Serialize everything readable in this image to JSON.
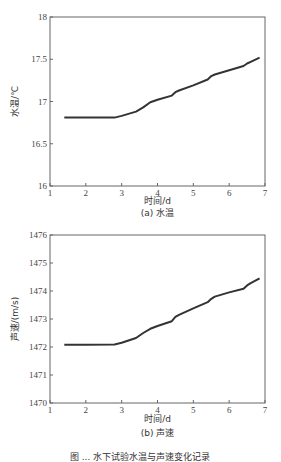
{
  "chart_data": [
    {
      "type": "line",
      "title": "",
      "caption": "(a) 水温",
      "xlabel": "时间/d",
      "ylabel": "水温/℃",
      "xlim": [
        1,
        7
      ],
      "ylim": [
        16,
        18
      ],
      "xticks": [
        "1",
        "2",
        "3",
        "4",
        "5",
        "6",
        "7"
      ],
      "yticks": [
        "16",
        "16.5",
        "17",
        "17.5",
        "18"
      ],
      "grid": false,
      "series": [
        {
          "name": "水温",
          "x": [
            1.4,
            2.0,
            2.8,
            3.0,
            3.4,
            3.6,
            3.8,
            4.0,
            4.4,
            4.5,
            4.6,
            5.0,
            5.4,
            5.5,
            5.6,
            6.0,
            6.4,
            6.5,
            6.6,
            6.85
          ],
          "y": [
            16.81,
            16.81,
            16.81,
            16.83,
            16.88,
            16.93,
            16.99,
            17.02,
            17.07,
            17.11,
            17.13,
            17.19,
            17.26,
            17.3,
            17.32,
            17.37,
            17.42,
            17.45,
            17.47,
            17.52
          ]
        }
      ]
    },
    {
      "type": "line",
      "title": "",
      "caption": "(b) 声速",
      "xlabel": "时间/d",
      "ylabel": "声速/(m/s)",
      "xlim": [
        1,
        7
      ],
      "ylim": [
        1470,
        1476
      ],
      "xticks": [
        "1",
        "2",
        "3",
        "4",
        "5",
        "6",
        "7"
      ],
      "yticks": [
        "1470",
        "1471",
        "1472",
        "1473",
        "1474",
        "1475",
        "1476"
      ],
      "grid": false,
      "series": [
        {
          "name": "声速",
          "x": [
            1.4,
            2.0,
            2.8,
            3.0,
            3.4,
            3.6,
            3.8,
            4.0,
            4.4,
            4.5,
            4.6,
            5.0,
            5.4,
            5.5,
            5.6,
            6.0,
            6.4,
            6.5,
            6.6,
            6.85
          ],
          "y": [
            1472.08,
            1472.08,
            1472.09,
            1472.15,
            1472.32,
            1472.5,
            1472.65,
            1472.75,
            1472.92,
            1473.08,
            1473.15,
            1473.38,
            1473.6,
            1473.72,
            1473.8,
            1473.95,
            1474.08,
            1474.2,
            1474.28,
            1474.45
          ]
        }
      ]
    }
  ],
  "figure_caption": "图 ... 水下试验水温与声速变化记录"
}
